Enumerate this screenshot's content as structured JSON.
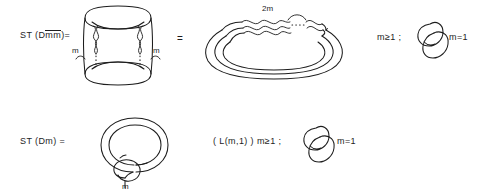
{
  "figure": {
    "title": "",
    "background_color": "#ffffff",
    "ink_color": "#1d1d1d"
  },
  "rows": {
    "top": {
      "lhs_label": "ST (D",
      "lhs_label_overline_1": "m",
      "lhs_label_overline_2": "m",
      "lhs_label_close": ")=",
      "lhs_label_full": "ST (Dm̄m̄)=",
      "twist_label_left": "m",
      "twist_label_right": "m",
      "equals_sign": "=",
      "rhs_twist_label": "2m",
      "condition_left": "m≥1 ;",
      "condition_right": "m=1",
      "link_name": "hopf-link"
    },
    "bottom": {
      "lhs_label": "ST (Dm) =",
      "coil_label": "m",
      "rhs_label": "( L(m,1) )  m≥1 ;",
      "condition_right": "m=1",
      "link_name": "hopf-link"
    }
  },
  "diagrams": {
    "top_left": {
      "name": "twisted-double-torus-diagram",
      "description": "two horizontal loops joined by two vertical twisted strands"
    },
    "top_right": {
      "name": "twisted-band-loop-diagram",
      "description": "closed band with 2m twists along the top"
    },
    "top_far_right": {
      "name": "hopf-link-diagram",
      "description": "two interlocked circles"
    },
    "bottom_left": {
      "name": "coiled-spiral-knot-diagram",
      "description": "spiral curve with small clasping loop labeled m"
    },
    "bottom_right": {
      "name": "hopf-link-diagram",
      "description": "two interlocked circles"
    }
  }
}
